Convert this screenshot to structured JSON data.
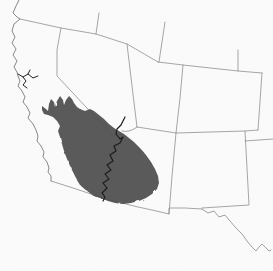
{
  "figure": {
    "kind": "species-range-map",
    "region_name": "southwestern-united-states",
    "background_color": "#fcfcfc",
    "border_color": "#8f8f8f",
    "coast_color": "#7a7a7a",
    "range_fill_color": "#4e4e4e",
    "river_dark_color": "#1c1c1c",
    "river_gray_color": "#8a8a8a"
  },
  "map": {
    "width": 273,
    "height": 271,
    "layers": [
      {
        "name": "state-borders",
        "kind": "line",
        "stroke": "#8f8f8f",
        "stroke_width": 0.8,
        "path": "M20,19 L61,28 L96,34 L127,44 L158,62 M99,13 L96,34 M165,22 L159,62 M158,62 L183,65 L238,71 L262,73 M238,50 L238,71 M262,73 L258,130 M258,130 L245,131 L176,133 L137,127 M183,65 L180,98 L176,133 M176,133 L172,176 L169,214 M245,131 L249,205 L202,208 M245,141 L273,139 M61,28 L57,50 L57,76 L114,137 M127,44 L132,86 L137,127 M137,127 Q129,133 122,131"
      },
      {
        "name": "mexico-border",
        "kind": "line",
        "stroke": "#8f8f8f",
        "stroke_width": 0.8,
        "path": "M51,181 L70,187 L88,193 L105,199 L122,203 L138,207 L152,210 L169,214 L169,208 L185,208 L202,209"
      },
      {
        "name": "pacific-coastline",
        "kind": "line",
        "stroke": "#7a7a7a",
        "stroke_width": 0.9,
        "path": "M19,0 L16,6 L13,13 L17,17 L20,19 L14,24 L12,31 L15,37 L12,43 L16,49 L13,55 L17,61 L14,67 L17,72 L18,76 L20,81 L18,86 L22,91 L25,97 L23,102 L27,107 L30,113 L28,118 L33,124 L36,130 L38,136 L37,141 L41,146 L44,152 L43,157 L47,162 L49,168 L48,172 L51,176 L51,181"
      },
      {
        "name": "range-overlay",
        "kind": "area",
        "fill": "#4e4e4e",
        "opacity": 0.92,
        "use_roughen": true,
        "path": "M44,114 L42,110 L42,106 L46,109 L48,111 L49,104 L51,99 L54,102 L55,107 L57,101 L60,96 L63,100 L64,105 L66,100 L69,96 L72,99 L74,103 L77,107 L80,109 L85,111 L90,109 L94,111 L99,115 L104,119 L109,124 L114,128 L119,131 L124,134 L129,138 L134,142 L140,148 L146,155 L151,162 L155,169 L158,176 L159,183 L157,189 L152,194 L146,198 L139,201 L131,203 L123,204 L115,203 L108,201 L103,199 L97,197 L91,194 L86,190 L81,186 L76,178 L71,168 L67,159 L64,151 L62,144 L60,137 L58,131 L60,126 L57,121 L53,117 L48,115 Z"
      },
      {
        "name": "colorado-river",
        "kind": "line",
        "stroke": "#1c1c1c",
        "stroke_width": 1.2,
        "path": "M125,117 L121,125 L117,129 L116,134 L120,139 L123,137 L120,143 L114,146 L116,151 L110,155 L113,161 L107,165 L111,170 L105,174 L109,179 L103,183 L107,188 L102,193 L105,197 L103,201"
      },
      {
        "name": "rio-grande-river",
        "kind": "line",
        "stroke": "#8a8a8a",
        "stroke_width": 0.8,
        "path": "M202,209 L208,213 L214,211 L219,217 L225,215 L230,221 L236,228 L242,234 L247,241 L252,247 L256,251 L259,247 L262,244 L265,247 L269,251 L271,250"
      },
      {
        "name": "san-francisco-bay",
        "kind": "line",
        "stroke": "#222222",
        "stroke_width": 1.0,
        "path": "M18,74 L23,77 L28,74 L33,78 L38,76 M23,77 L26,81 L23,85 L27,88 M28,74 L30,70"
      }
    ]
  }
}
